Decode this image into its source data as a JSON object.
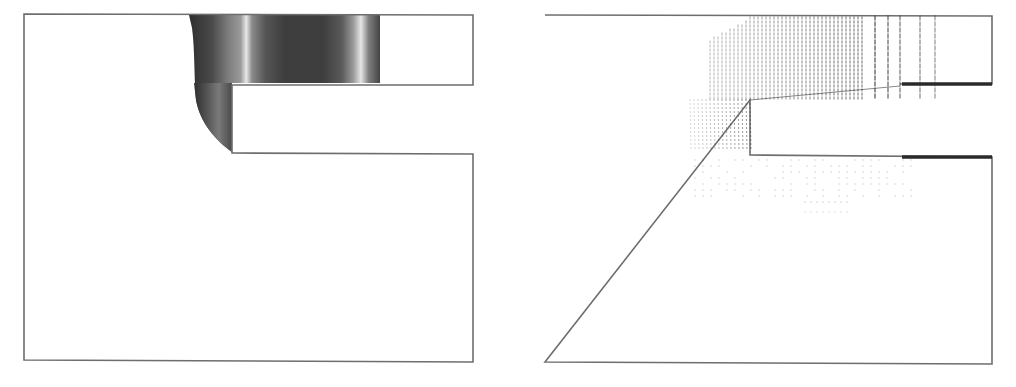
{
  "figure": {
    "panels": [
      {
        "id": "left",
        "kind": "contour-plot",
        "description": "Grayscale contour field in channel near step",
        "colors": {
          "frame": "#6e6e6e",
          "dark": "#3a3a3a",
          "mid": "#6a6a6a",
          "light": "#b8b8b8",
          "highlight": "#e6e6e6"
        }
      },
      {
        "id": "right",
        "kind": "vector-field",
        "description": "Velocity vector field near channel step",
        "colors": {
          "frame": "#6e6e6e",
          "arrow": "#333333",
          "wall": "#2a2a2a"
        }
      }
    ]
  }
}
